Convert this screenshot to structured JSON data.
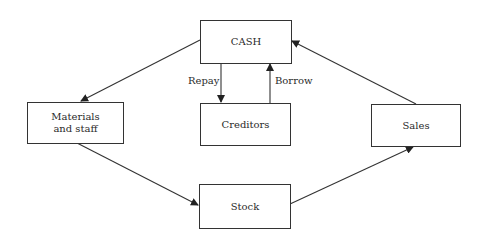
{
  "diagram": {
    "nodes": {
      "cash": "CASH",
      "creditors": "Creditors",
      "materials": "Materials and staff",
      "sales": "Sales",
      "stock": "Stock"
    },
    "edges": [
      {
        "from": "CASH",
        "to": "Materials and staff",
        "label": ""
      },
      {
        "from": "CASH",
        "to": "Creditors",
        "label": "Repay"
      },
      {
        "from": "Creditors",
        "to": "CASH",
        "label": "Borrow"
      },
      {
        "from": "Materials and staff",
        "to": "Stock",
        "label": ""
      },
      {
        "from": "Stock",
        "to": "Sales",
        "label": ""
      },
      {
        "from": "Sales",
        "to": "CASH",
        "label": ""
      }
    ],
    "labels": {
      "repay": "Repay",
      "borrow": "Borrow"
    },
    "colors": {
      "line": "#333333",
      "text": "#2a2a2a",
      "background": "#ffffff"
    }
  }
}
